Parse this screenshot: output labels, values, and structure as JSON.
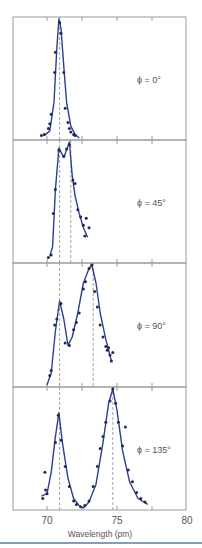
{
  "chart_data": [
    {
      "type": "line",
      "title": "",
      "panel_label": "ϕ = 0°",
      "xlabel": "Wavelength (pm)",
      "ylabel": "",
      "xlim": [
        69.5,
        79.7
      ],
      "dashed_lines": [
        70.9
      ],
      "curve": [
        [
          69.8,
          0.02
        ],
        [
          70.2,
          0.06
        ],
        [
          70.5,
          0.3
        ],
        [
          70.7,
          0.75
        ],
        [
          70.85,
          1.0
        ],
        [
          71.0,
          0.92
        ],
        [
          71.2,
          0.6
        ],
        [
          71.4,
          0.3
        ],
        [
          71.7,
          0.1
        ],
        [
          72.0,
          0.03
        ],
        [
          72.3,
          0.0
        ]
      ],
      "points": [
        [
          69.6,
          0.02
        ],
        [
          69.8,
          0.03
        ],
        [
          70.1,
          0.08
        ],
        [
          70.2,
          0.12
        ],
        [
          70.3,
          0.2
        ],
        [
          70.55,
          0.55
        ],
        [
          70.6,
          0.72
        ],
        [
          70.9,
          0.97
        ],
        [
          71.0,
          0.88
        ],
        [
          71.2,
          0.55
        ],
        [
          71.3,
          0.25
        ],
        [
          71.5,
          0.13
        ],
        [
          71.6,
          0.08
        ],
        [
          71.7,
          0.05
        ],
        [
          71.9,
          0.03
        ],
        [
          72.0,
          0.02
        ]
      ]
    },
    {
      "type": "line",
      "panel_label": "ϕ = 45°",
      "xlabel": "Wavelength (pm)",
      "xlim": [
        69.5,
        79.7
      ],
      "dashed_lines": [
        70.9,
        71.7
      ],
      "curve": [
        [
          70.2,
          0.04
        ],
        [
          70.4,
          0.12
        ],
        [
          70.6,
          0.6
        ],
        [
          70.85,
          0.95
        ],
        [
          71.2,
          0.87
        ],
        [
          71.45,
          0.95
        ],
        [
          71.6,
          1.0
        ],
        [
          71.8,
          0.72
        ],
        [
          72.0,
          0.55
        ],
        [
          72.3,
          0.4
        ],
        [
          72.6,
          0.28
        ],
        [
          72.9,
          0.2
        ]
      ],
      "points": [
        [
          70.1,
          0.03
        ],
        [
          70.3,
          0.05
        ],
        [
          70.45,
          0.4
        ],
        [
          70.6,
          0.6
        ],
        [
          70.85,
          0.93
        ],
        [
          71.2,
          0.88
        ],
        [
          71.4,
          0.94
        ],
        [
          71.6,
          0.98
        ],
        [
          71.85,
          0.68
        ],
        [
          72.0,
          0.65
        ],
        [
          72.2,
          0.43
        ],
        [
          72.4,
          0.37
        ],
        [
          72.6,
          0.3
        ],
        [
          72.7,
          0.21
        ],
        [
          72.8,
          0.36
        ],
        [
          73.0,
          0.28
        ]
      ]
    },
    {
      "type": "line",
      "panel_label": "ϕ = 90°",
      "xlabel": "Wavelength (pm)",
      "xlim": [
        69.5,
        79.7
      ],
      "dashed_lines": [
        70.9,
        73.3
      ],
      "curve": [
        [
          70.0,
          0.0
        ],
        [
          70.3,
          0.1
        ],
        [
          70.6,
          0.45
        ],
        [
          70.9,
          0.7
        ],
        [
          71.2,
          0.55
        ],
        [
          71.5,
          0.33
        ],
        [
          71.8,
          0.4
        ],
        [
          72.2,
          0.6
        ],
        [
          72.6,
          0.85
        ],
        [
          73.0,
          0.97
        ],
        [
          73.2,
          1.0
        ],
        [
          73.5,
          0.85
        ],
        [
          73.8,
          0.6
        ],
        [
          74.2,
          0.38
        ],
        [
          74.6,
          0.2
        ]
      ],
      "points": [
        [
          70.2,
          0.08
        ],
        [
          70.3,
          0.12
        ],
        [
          70.55,
          0.5
        ],
        [
          70.7,
          0.55
        ],
        [
          71.0,
          0.68
        ],
        [
          71.3,
          0.35
        ],
        [
          71.6,
          0.33
        ],
        [
          71.9,
          0.46
        ],
        [
          72.1,
          0.52
        ],
        [
          72.3,
          0.6
        ],
        [
          72.6,
          0.8
        ],
        [
          72.75,
          0.86
        ],
        [
          73.0,
          0.97
        ],
        [
          73.2,
          1.0
        ],
        [
          73.4,
          0.78
        ],
        [
          73.6,
          0.65
        ],
        [
          73.8,
          0.5
        ],
        [
          74.0,
          0.4
        ],
        [
          74.2,
          0.32
        ],
        [
          74.3,
          0.29
        ],
        [
          74.4,
          0.31
        ],
        [
          74.5,
          0.25
        ],
        [
          74.7,
          0.27
        ],
        [
          74.6,
          0.2
        ]
      ]
    },
    {
      "type": "line",
      "panel_label": "ϕ = 135°",
      "xlabel": "Wavelength (pm)",
      "xlim": [
        69.5,
        79.7
      ],
      "dashed_lines": [
        70.9,
        74.7
      ],
      "curve": [
        [
          69.6,
          0.1
        ],
        [
          70.0,
          0.12
        ],
        [
          70.3,
          0.3
        ],
        [
          70.6,
          0.6
        ],
        [
          70.85,
          0.8
        ],
        [
          71.1,
          0.55
        ],
        [
          71.5,
          0.25
        ],
        [
          71.9,
          0.08
        ],
        [
          72.3,
          0.02
        ],
        [
          72.6,
          0.0
        ],
        [
          73.0,
          0.05
        ],
        [
          73.5,
          0.2
        ],
        [
          74.0,
          0.55
        ],
        [
          74.4,
          0.88
        ],
        [
          74.7,
          1.0
        ],
        [
          75.0,
          0.82
        ],
        [
          75.4,
          0.48
        ],
        [
          75.9,
          0.22
        ],
        [
          76.5,
          0.08
        ],
        [
          77.2,
          0.03
        ]
      ],
      "points": [
        [
          69.7,
          0.08
        ],
        [
          69.85,
          0.3
        ],
        [
          69.9,
          0.15
        ],
        [
          70.0,
          0.12
        ],
        [
          70.6,
          0.55
        ],
        [
          70.8,
          0.78
        ],
        [
          71.0,
          0.57
        ],
        [
          71.3,
          0.35
        ],
        [
          71.6,
          0.18
        ],
        [
          71.9,
          0.06
        ],
        [
          72.1,
          0.03
        ],
        [
          72.4,
          0.01
        ],
        [
          72.7,
          0.02
        ],
        [
          73.0,
          0.06
        ],
        [
          73.3,
          0.18
        ],
        [
          73.6,
          0.35
        ],
        [
          73.8,
          0.5
        ],
        [
          74.0,
          0.6
        ],
        [
          74.2,
          0.72
        ],
        [
          74.5,
          0.9
        ],
        [
          74.7,
          1.0
        ],
        [
          74.9,
          0.88
        ],
        [
          75.1,
          0.72
        ],
        [
          75.4,
          0.52
        ],
        [
          75.6,
          0.68
        ],
        [
          75.8,
          0.32
        ],
        [
          76.1,
          0.22
        ],
        [
          76.4,
          0.13
        ],
        [
          76.7,
          0.08
        ],
        [
          77.0,
          0.05
        ]
      ]
    }
  ],
  "axis": {
    "ticks": [
      {
        "value": 70,
        "label": "70"
      },
      {
        "value": 75,
        "label": "75"
      },
      {
        "value": 80,
        "label": "80"
      }
    ],
    "minor_ticks": [
      72.5,
      77.5
    ],
    "xlabel": "Wavelength (pm)"
  },
  "colors": {
    "curve": "#2b3f96",
    "points": "#262b45",
    "frame": "#9a9a9a",
    "dashed": "#8a8a8a",
    "text": "#555555",
    "bottom_rule": "#8a9bbd"
  }
}
